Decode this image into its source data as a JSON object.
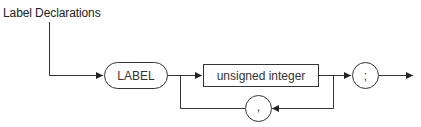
{
  "diagram": {
    "title": "Label Declarations",
    "type": "syntax-diagram",
    "nodes": [
      {
        "id": "label-keyword",
        "shape": "rounded",
        "text": "LABEL"
      },
      {
        "id": "unsigned-integer",
        "shape": "rectangle",
        "text": "unsigned integer"
      },
      {
        "id": "comma",
        "shape": "circle",
        "text": ","
      },
      {
        "id": "semicolon",
        "shape": "circle",
        "text": ";"
      }
    ],
    "edges": [
      {
        "from": "start",
        "to": "label-keyword"
      },
      {
        "from": "label-keyword",
        "to": "unsigned-integer"
      },
      {
        "from": "unsigned-integer",
        "to": "semicolon"
      },
      {
        "from": "unsigned-integer",
        "to": "comma",
        "note": "loop back"
      },
      {
        "from": "comma",
        "to": "unsigned-integer",
        "note": "loop back"
      },
      {
        "from": "semicolon",
        "to": "end"
      }
    ],
    "colors": {
      "stroke": "#333333",
      "text": "#333333",
      "background": "#ffffff"
    }
  }
}
